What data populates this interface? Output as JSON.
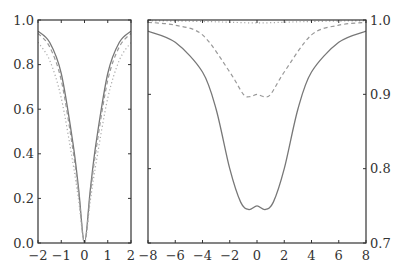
{
  "chart_data": [
    {
      "type": "line",
      "title": "",
      "xlabel": "",
      "ylabel": "",
      "xlim": [
        -2,
        2
      ],
      "ylim": [
        0,
        1
      ],
      "xticks": [
        "−2",
        "−1",
        "0",
        "1",
        "2"
      ],
      "yticks": [
        "0.0",
        "0.2",
        "0.4",
        "0.6",
        "0.8",
        "1.0"
      ],
      "yaxis_side": "left",
      "grid": false,
      "series": [
        {
          "name": "solid",
          "style": "solid",
          "x": [
            -2,
            -1.5,
            -1,
            -0.5,
            -0.25,
            0,
            0.25,
            0.5,
            1,
            1.5,
            2
          ],
          "values": [
            0.95,
            0.9,
            0.76,
            0.45,
            0.24,
            0.0,
            0.24,
            0.45,
            0.76,
            0.9,
            0.95
          ]
        },
        {
          "name": "dashed",
          "style": "dashed",
          "x": [
            -2,
            -1.5,
            -1,
            -0.5,
            -0.25,
            0,
            0.25,
            0.5,
            1,
            1.5,
            2
          ],
          "values": [
            0.94,
            0.88,
            0.73,
            0.42,
            0.22,
            0.0,
            0.22,
            0.42,
            0.73,
            0.88,
            0.94
          ]
        },
        {
          "name": "dotted",
          "style": "dotted",
          "x": [
            -2,
            -1.5,
            -1,
            -0.5,
            -0.25,
            0,
            0.25,
            0.5,
            1,
            1.5,
            2
          ],
          "values": [
            0.9,
            0.82,
            0.65,
            0.36,
            0.19,
            0.0,
            0.19,
            0.36,
            0.65,
            0.82,
            0.9
          ]
        }
      ]
    },
    {
      "type": "line",
      "title": "",
      "xlabel": "",
      "ylabel": "",
      "xlim": [
        -8,
        8
      ],
      "ylim": [
        0.7,
        1.0
      ],
      "xticks": [
        "−8",
        "−6",
        "−4",
        "−2",
        "0",
        "2",
        "4",
        "6",
        "8"
      ],
      "yticks": [
        "0.7",
        "0.8",
        "0.9",
        "1.0"
      ],
      "yaxis_side": "right",
      "grid": false,
      "series": [
        {
          "name": "solid",
          "style": "solid",
          "x": [
            -8,
            -6,
            -4,
            -3,
            -2,
            -1.2,
            -0.6,
            0,
            0.6,
            1.2,
            2,
            3,
            4,
            6,
            8
          ],
          "values": [
            0.985,
            0.97,
            0.93,
            0.88,
            0.8,
            0.755,
            0.745,
            0.75,
            0.745,
            0.755,
            0.8,
            0.88,
            0.93,
            0.97,
            0.985
          ]
        },
        {
          "name": "dashed",
          "style": "dashed",
          "x": [
            -8,
            -6,
            -4,
            -2,
            -1,
            -0.5,
            0,
            0.5,
            1,
            2,
            4,
            6,
            8
          ],
          "values": [
            0.997,
            0.993,
            0.98,
            0.93,
            0.9,
            0.897,
            0.9,
            0.897,
            0.9,
            0.93,
            0.98,
            0.993,
            0.997
          ]
        },
        {
          "name": "dotted",
          "style": "dotted",
          "x": [
            -8,
            -4,
            -2,
            0,
            2,
            4,
            8
          ],
          "values": [
            0.999,
            0.998,
            0.997,
            0.996,
            0.997,
            0.998,
            0.999
          ]
        }
      ]
    }
  ],
  "colors": {
    "solid": "#777777",
    "dashed": "#999999",
    "dotted": "#aaaaaa",
    "axis": "#333333"
  }
}
